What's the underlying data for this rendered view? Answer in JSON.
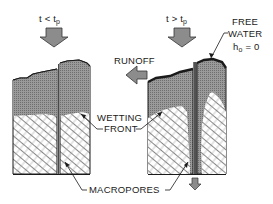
{
  "diagram": {
    "panels": [
      {
        "id": "before-ponding",
        "condition_main": "t < t",
        "condition_sub": "p"
      },
      {
        "id": "after-ponding",
        "condition_main": "t > t",
        "condition_sub": "p"
      }
    ],
    "labels": {
      "runoff": "RUNOFF",
      "free_water_line1": "FREE",
      "free_water_line2": "WATER",
      "head_main": "h",
      "head_sub": "o",
      "head_value": " = 0",
      "wetting_line1": "WETTING",
      "wetting_line2": "FRONT",
      "macropores": "MACROPORES"
    },
    "colors": {
      "saturated_fill": "#8a8a8a",
      "outline": "#1a1a1a",
      "arrow_fill": "#8c8c8c",
      "hatch": "#444444",
      "background": "#ffffff"
    }
  }
}
